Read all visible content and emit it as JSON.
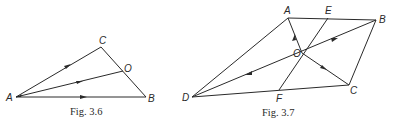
{
  "figures": [
    {
      "id": "fig-3-6",
      "caption": "Fig. 3.6",
      "points": {
        "A": {
          "label": "A",
          "x": 16,
          "y": 97
        },
        "C": {
          "label": "C",
          "x": 101,
          "y": 47
        },
        "O": {
          "label": "O",
          "x": 123,
          "y": 71
        },
        "B": {
          "label": "B",
          "x": 146,
          "y": 97
        }
      },
      "segments": [
        "A-C",
        "C-B",
        "A-B",
        "A-O"
      ],
      "arrows": [
        "A->C",
        "A->O",
        "A->B"
      ]
    },
    {
      "id": "fig-3-7",
      "caption": "Fig. 3.7",
      "points": {
        "A": {
          "label": "A",
          "x": 288,
          "y": 18
        },
        "E": {
          "label": "E",
          "x": 328,
          "y": 18
        },
        "B": {
          "label": "B",
          "x": 376,
          "y": 20
        },
        "O": {
          "label": "O",
          "x": 302,
          "y": 53
        },
        "C": {
          "label": "C",
          "x": 349,
          "y": 85
        },
        "F": {
          "label": "F",
          "x": 279,
          "y": 90
        },
        "D": {
          "label": "D",
          "x": 192,
          "y": 97
        }
      },
      "segments": [
        "A-B",
        "B-C",
        "C-D",
        "D-A",
        "E-F",
        "D-B",
        "O-A",
        "O-C"
      ],
      "arrows": [
        "O->A",
        "O->B",
        "O->C",
        "O->D"
      ]
    }
  ]
}
